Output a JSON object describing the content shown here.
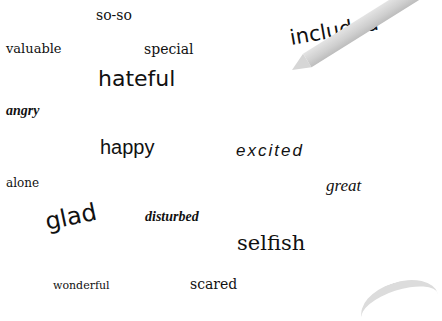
{
  "words": [
    {
      "text": "so-so"
    },
    {
      "text": "valuable"
    },
    {
      "text": "special"
    },
    {
      "text": "hateful"
    },
    {
      "text": "included"
    },
    {
      "text": "angry"
    },
    {
      "text": "happy"
    },
    {
      "text": "excited"
    },
    {
      "text": "alone"
    },
    {
      "text": "great"
    },
    {
      "text": "glad"
    },
    {
      "text": "disturbed"
    },
    {
      "text": "selfish"
    },
    {
      "text": "wonderful"
    },
    {
      "text": "scared"
    }
  ],
  "objects": {
    "pencil": "pencil-shape",
    "corner_arc": "paper-curl-shape"
  }
}
